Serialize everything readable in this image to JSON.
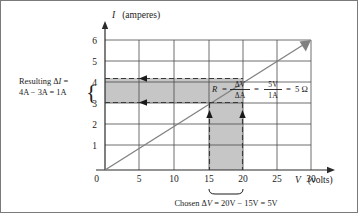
{
  "figure": {
    "border_color": "#7a7a7a"
  },
  "chart_data": {
    "type": "line",
    "title": "",
    "xlabel": "V (volts)",
    "xlabel_symbol": "V",
    "xlabel_unit": "(volts)",
    "ylabel": "I (amperes)",
    "ylabel_symbol": "I",
    "ylabel_unit": "(amperes)",
    "xlim": [
      0,
      30
    ],
    "ylim": [
      0,
      6
    ],
    "xticks": [
      "0",
      "5",
      "10",
      "15",
      "20",
      "25",
      "30"
    ],
    "xtick_values": [
      0,
      5,
      10,
      15,
      20,
      25,
      30
    ],
    "yticks": [
      "0",
      "1",
      "2",
      "3",
      "4",
      "5",
      "6"
    ],
    "ytick_values": [
      0,
      1,
      2,
      3,
      4,
      5,
      6
    ],
    "grid": true,
    "legend": "none",
    "series": [
      {
        "name": "I vs V",
        "x": [
          0,
          30
        ],
        "values": [
          0,
          6
        ],
        "slope_amperes_per_volt": 0.2,
        "color": "#808080",
        "arrow_at_end": true
      }
    ],
    "annotations": {
      "horizontal_band": {
        "y_from": 3,
        "y_to": 4,
        "x_from": 0,
        "x_to": 20,
        "fill": "#c6c6c6",
        "edge_style": "dashed",
        "arrow_direction": "left"
      },
      "vertical_band": {
        "x_from": 15,
        "x_to": 20,
        "y_from": 0,
        "y_to": 3,
        "fill": "#c6c6c6",
        "edge_style": "dashed",
        "arrow_direction": "up"
      },
      "intersection_point": {
        "x": 15,
        "y": 3
      },
      "second_point": {
        "x": 20,
        "y": 4
      }
    }
  },
  "labels": {
    "left_annotation": {
      "line1_prefix": "Resulting ",
      "line1_delta": "Δ",
      "line1_symbol": "I",
      "line1_suffix": " =",
      "line2": "4A − 3A = 1A",
      "brace": "{",
      "brace_top_value": "4",
      "brace_bottom_value": "3"
    },
    "bottom_annotation": {
      "prefix": "Chosen ",
      "delta": "Δ",
      "symbol": "V",
      "equation": " = 20V − 15V = 5V",
      "brace": "⏟"
    },
    "formula": {
      "variable": "R",
      "equals1": "=",
      "frac1_num_delta": "Δ",
      "frac1_num_unit": "V",
      "frac1_den_delta": "Δ",
      "frac1_den_unit": "A",
      "equals2": "=",
      "frac2_num": "5V",
      "frac2_den": "1A",
      "equals3": "=",
      "result": "5 Ω"
    }
  },
  "colors": {
    "band_fill": "#c6c6c6",
    "grid_line": "#4a4a4a",
    "axis_line": "#2b2b2b",
    "data_line": "#808080",
    "text": "#1a1a1a"
  }
}
